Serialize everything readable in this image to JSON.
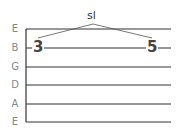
{
  "diagram": {
    "type": "guitar-tablature",
    "strings": [
      "E",
      "B",
      "G",
      "D",
      "A",
      "E"
    ],
    "notes": [
      {
        "string": "B",
        "fret": "3"
      },
      {
        "string": "B",
        "fret": "5"
      }
    ],
    "technique": {
      "label": "sl",
      "meaning": "slide",
      "from_fret": "3",
      "to_fret": "5"
    },
    "colors": {
      "lines": "#333333",
      "labels": "#888888",
      "frets": "#444444"
    }
  }
}
